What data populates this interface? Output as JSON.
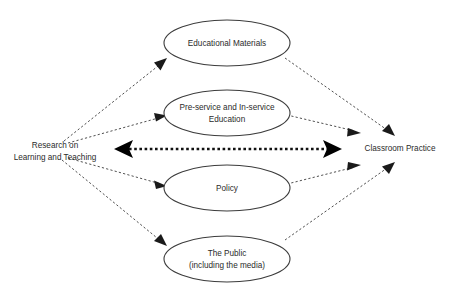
{
  "diagram": {
    "background_color": "#ffffff",
    "stroke_color": "#3c3c3c",
    "text_color": "#2b2b2b",
    "endpoints": {
      "left": {
        "name": "research-node",
        "line1": "Research on",
        "line2": "Learning and Teaching",
        "x": 55,
        "y": 149
      },
      "right": {
        "name": "classroom-practice-node",
        "line1": "Classroom Practice",
        "x": 400,
        "y": 149
      }
    },
    "mediators": [
      {
        "id": "educational-materials",
        "line1": "Educational Materials",
        "line2": "",
        "cx": 227,
        "cy": 43,
        "rx": 63,
        "ry": 23
      },
      {
        "id": "pre-service-and-in-service-education",
        "line1": "Pre-service and In-service",
        "line2": "Education",
        "cx": 227,
        "cy": 113,
        "rx": 63,
        "ry": 23
      },
      {
        "id": "policy",
        "line1": "Policy",
        "line2": "",
        "cx": 227,
        "cy": 188,
        "rx": 63,
        "ry": 23
      },
      {
        "id": "the-public",
        "line1": "The Public",
        "line2": "(including the media)",
        "cx": 227,
        "cy": 259,
        "rx": 63,
        "ry": 23
      }
    ],
    "center_arrow": {
      "id": "research-classroom-bidirectional-arrow",
      "label": "",
      "style": "dotted-double-headed",
      "x1": 118,
      "x2": 338,
      "y": 149
    },
    "links": [
      {
        "id": "research-to-educational-materials",
        "style": "dashed-arrow"
      },
      {
        "id": "research-to-pre-service-education",
        "style": "dashed-arrow"
      },
      {
        "id": "research-to-policy",
        "style": "dashed-arrow"
      },
      {
        "id": "research-to-the-public",
        "style": "dashed-arrow"
      },
      {
        "id": "educational-materials-to-classroom-practice",
        "style": "dashed-arrow"
      },
      {
        "id": "pre-service-education-to-classroom-practice",
        "style": "dashed-arrow"
      },
      {
        "id": "policy-to-classroom-practice",
        "style": "dashed-arrow"
      },
      {
        "id": "the-public-to-classroom-practice",
        "style": "dashed-arrow"
      }
    ]
  }
}
